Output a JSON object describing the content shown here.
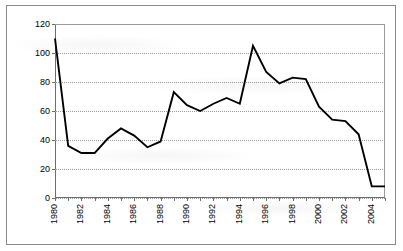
{
  "chart_data": {
    "type": "line",
    "title": "",
    "subtitle": "",
    "xlabel": "",
    "ylabel": "",
    "xlim": [
      1980,
      2005
    ],
    "ylim": [
      0,
      120
    ],
    "grid": true,
    "legend": false,
    "legend_position": "none",
    "line_color": "#000000",
    "y_ticks": [
      0,
      20,
      40,
      60,
      80,
      100,
      120
    ],
    "y_tick_labels": [
      "0",
      "20",
      "40",
      "60",
      "80",
      "100",
      "120"
    ],
    "x_tick_labels": [
      "1980",
      "1982",
      "1984",
      "1986",
      "1988",
      "1990",
      "1992",
      "1994",
      "1996",
      "1998",
      "2000",
      "2002",
      "2004"
    ],
    "x_tick_step_years": 2,
    "x_minor_tick_step_years": 1,
    "x": [
      1980,
      1981,
      1982,
      1983,
      1984,
      1985,
      1986,
      1987,
      1988,
      1989,
      1990,
      1991,
      1992,
      1993,
      1994,
      1995,
      1996,
      1997,
      1998,
      1999,
      2000,
      2001,
      2002,
      2003,
      2004,
      2005
    ],
    "values": [
      110,
      36,
      31,
      31,
      41,
      48,
      43,
      35,
      39,
      73,
      64,
      60,
      65,
      69,
      65,
      105,
      87,
      79,
      83,
      82,
      63,
      54,
      53,
      44,
      8,
      8
    ],
    "series": [
      {
        "name": "series-1",
        "color": "#000000",
        "values": [
          110,
          36,
          31,
          31,
          41,
          48,
          43,
          35,
          39,
          73,
          64,
          60,
          65,
          69,
          65,
          105,
          87,
          79,
          83,
          82,
          63,
          54,
          53,
          44,
          8,
          8
        ]
      }
    ],
    "annotations": []
  }
}
